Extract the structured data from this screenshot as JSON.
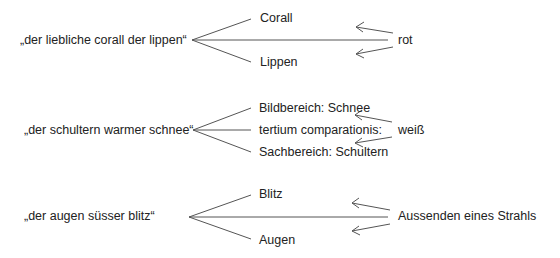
{
  "diagram": {
    "rows": [
      {
        "phrase": "„der liebliche corall der lippen“",
        "upper": "Corall",
        "middle": "",
        "lower": "Lippen",
        "tertium": "rot"
      },
      {
        "phrase": "„der schultern warmer schnee“",
        "upper": "Bildbereich: Schnee",
        "middle": "tertium comparationis:",
        "lower": "Sachbereich: Schultern",
        "tertium": "weiß"
      },
      {
        "phrase": "„der augen süsser blitz“",
        "upper": "Blitz",
        "middle": "",
        "lower": "Augen",
        "tertium": "Aussenden eines Strahls"
      }
    ],
    "colors": {
      "line": "#555555",
      "text": "#222222"
    }
  }
}
